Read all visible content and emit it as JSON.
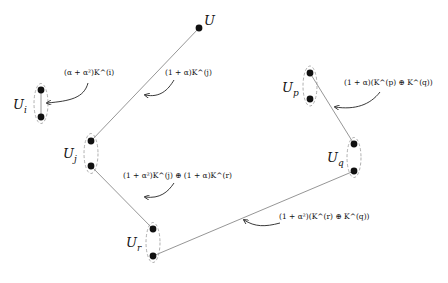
{
  "diagram": {
    "nodes": [
      {
        "id": "U",
        "label": "U",
        "sub": ""
      },
      {
        "id": "Ui",
        "label": "U",
        "sub": "i"
      },
      {
        "id": "Uj",
        "label": "U",
        "sub": "j"
      },
      {
        "id": "Up",
        "label": "U",
        "sub": "p"
      },
      {
        "id": "Uq",
        "label": "U",
        "sub": "q"
      },
      {
        "id": "Ur",
        "label": "U",
        "sub": "r"
      }
    ],
    "edges": [
      {
        "from": "U",
        "to": "Uj",
        "label": "(1 + α)K^(j)",
        "text": "(1 + α)K",
        "sup": "(j)"
      },
      {
        "from": "Ui",
        "to": "Ui",
        "label": "(α + α²)K^(i)",
        "text": "(α + α²)K",
        "sup": "(i)"
      },
      {
        "from": "Uj",
        "to": "Ur",
        "label": "(1 + α²)K^(j) ⊕ (1 + α)K^(r)"
      },
      {
        "from": "Up",
        "to": "Uq",
        "label": "(1 + α)(K^(p) ⊕ K^(q))"
      },
      {
        "from": "Ur",
        "to": "Uq",
        "label": "(1 + α²)(K^(r) ⊕ K^(q))"
      }
    ],
    "colors": {
      "line": "#8a8a8a",
      "dot": "#111111",
      "dash": "#9a9a9a",
      "arrow": "#222222"
    }
  }
}
